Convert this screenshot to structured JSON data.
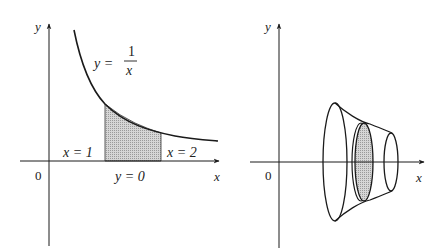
{
  "left_panel": {
    "axis_y_label": "y",
    "axis_x_label": "x",
    "origin_label": "0",
    "curve_label_lhs": "y =",
    "curve_label_num": "1",
    "curve_label_den": "x",
    "bound_left_label": "x = 1",
    "bound_right_label": "x = 2",
    "bound_bottom_label": "y = 0",
    "shade_color": "#c8c8c8"
  },
  "right_panel": {
    "axis_y_label": "y",
    "axis_x_label": "x",
    "origin_label": "0",
    "disk_color": "#c8c8c8"
  },
  "colors": {
    "stroke": "#1a1a1a",
    "background": "#ffffff"
  }
}
